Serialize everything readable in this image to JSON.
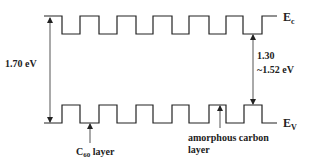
{
  "diagram": {
    "colors": {
      "line": "#222222",
      "arrow": "#555555",
      "text": "#222222"
    },
    "conduction_band": {
      "label_main": "E",
      "label_sub": "c",
      "points": "44,16 62,16 62,34 80,34 80,16 99,16 99,34 117,34 117,16 136,16 136,34 153,34 153,16 172,16 172,34 189,34 189,16 209,16 209,34 226,34 226,16 243,16 243,34 262,34 262,16 277,16"
    },
    "valence_band": {
      "label_main": "E",
      "label_sub": "V",
      "points": "44,123 62,123 62,105 80,105 80,123 99,123 99,105 117,105 117,123 136,123 136,105 153,105 153,123 172,123 172,105 189,105 189,123 209,123 209,105 226,105 226,123 244,123 244,105 262,105 262,123 277,123"
    },
    "left_gap": {
      "value": "1.70 eV"
    },
    "right_gap": {
      "line1": "1.30",
      "line2": "~1.52 eV"
    },
    "c60_label": {
      "main": "C",
      "sub": "60",
      "rest": " layer"
    },
    "amorphous_label": {
      "line1": "amorphous carbon",
      "line2": "layer"
    }
  }
}
